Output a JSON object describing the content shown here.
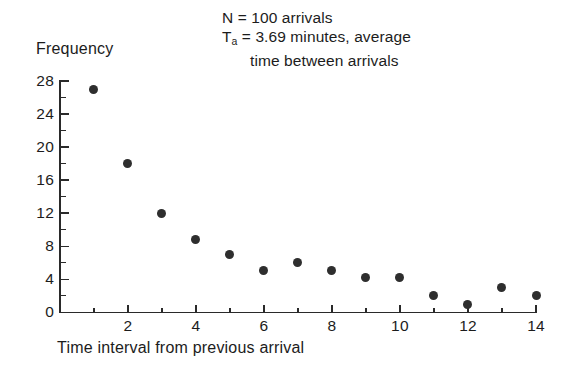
{
  "annotation": {
    "line1": "N = 100 arrivals",
    "line2_prefix": "T",
    "line2_sub": "a",
    "line2_rest": " = 3.69 minutes, average",
    "line3": "time between arrivals"
  },
  "chart_data": {
    "type": "scatter",
    "title": "",
    "xlabel": "Time interval from previous arrival",
    "ylabel": "Frequency",
    "xlim": [
      0,
      14.2
    ],
    "ylim": [
      0,
      28.8
    ],
    "grid": false,
    "legend": "none",
    "x_ticks_major": [
      2,
      4,
      6,
      8,
      10,
      12,
      14
    ],
    "x_ticks_minor": [
      1,
      3,
      5,
      7,
      9,
      11,
      13
    ],
    "y_ticks_major": [
      0,
      4,
      8,
      12,
      16,
      20,
      24,
      28
    ],
    "y_ticks_minor": [
      2,
      6,
      10,
      14,
      18,
      22,
      26
    ],
    "x_tick_labels": [
      "2",
      "4",
      "6",
      "8",
      "10",
      "12",
      "14"
    ],
    "y_tick_labels": [
      "0",
      "4",
      "8",
      "12",
      "16",
      "20",
      "24",
      "28"
    ],
    "x": [
      1,
      2,
      3,
      4,
      5,
      6,
      7,
      8,
      9,
      10,
      11,
      12,
      13,
      14
    ],
    "values": [
      27,
      18,
      12,
      8.8,
      7,
      5,
      6,
      5,
      4.2,
      4.2,
      2,
      1,
      3,
      2
    ],
    "marker_color": "#2e2e2e",
    "axis_color": "#2a2a2a"
  }
}
